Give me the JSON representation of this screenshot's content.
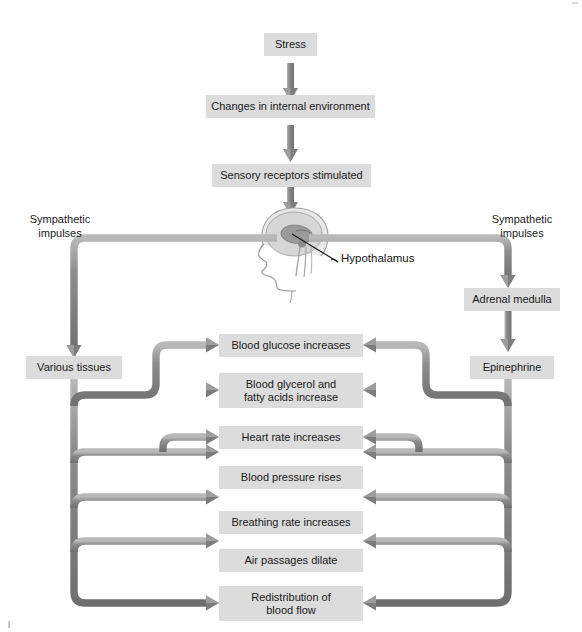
{
  "diagram": {
    "title_chain": [
      {
        "id": "stress",
        "label": "Stress"
      },
      {
        "id": "changes",
        "label": "Changes in internal environment"
      },
      {
        "id": "sensory",
        "label": "Sensory receptors stimulated"
      }
    ],
    "brain": {
      "organ_icon": "head-profile-brain-icon",
      "callout_label": "Hypothalamus"
    },
    "left_branch": {
      "impulse_label": "Sympathetic\nimpulses",
      "target_label": "Various tissues"
    },
    "right_branch": {
      "impulse_label": "Sympathetic\nimpulses",
      "gland_label": "Adrenal medulla",
      "hormone_label": "Epinephrine"
    },
    "effects": [
      {
        "id": "blood-glucose",
        "label": "Blood glucose increases"
      },
      {
        "id": "blood-glycerol",
        "label": "Blood glycerol and\nfatty acids increase"
      },
      {
        "id": "heart-rate",
        "label": "Heart rate increases"
      },
      {
        "id": "blood-pressure",
        "label": "Blood pressure rises"
      },
      {
        "id": "breathing-rate",
        "label": "Breathing rate increases"
      },
      {
        "id": "air-passages",
        "label": "Air passages dilate"
      },
      {
        "id": "redistribution",
        "label": "Redistribution of\nblood flow"
      }
    ],
    "colors": {
      "box_fill": "#dcdcdc",
      "pipe_mid": "#8a8a8a",
      "pipe_light": "#b4b4b4",
      "pipe_dark": "#6d6d6d",
      "text": "#1a1a1a",
      "page_bg": "#ffffff",
      "head_line": "#9a9a9a",
      "brain_fill": "#cfcfcf"
    }
  }
}
